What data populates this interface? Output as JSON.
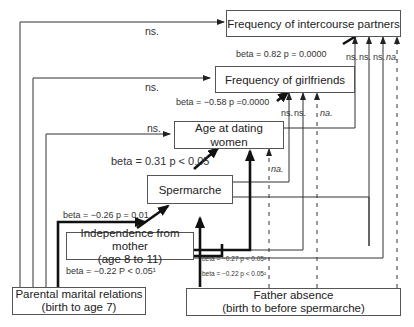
{
  "nodes": {
    "intercourse": {
      "label": "Frequency of intercourse partners"
    },
    "girlfriends": {
      "label": "Frequency of girlfriends"
    },
    "dating": {
      "label": "Age at dating women"
    },
    "spermarche": {
      "label": "Spermarche"
    },
    "independence": {
      "line1": "Independence from mother",
      "line2": "(age 8 to 11)"
    },
    "parental": {
      "line1": "Parental marital relations",
      "line2": "(birth to age 7)"
    },
    "father": {
      "line1": "Father absence",
      "line2": "(birth to before spermarche)"
    }
  },
  "edges": {
    "girlfriends_to_intercourse": "beta = 0.82 p = 0.0000",
    "dating_to_girlfriends": "beta = −0.58 p =0.0000",
    "spermarche_to_dating": "beta = 0.31 p < 0.05",
    "independence_to_spermarche": "beta = −0.26 p = 0.01",
    "parental_to_independence": "beta = −0.22 P < 0.05¹",
    "father_to_independence_a": "beta = −0.27 p < 0.05²",
    "father_to_independence_b": "beta = −0.22 p < 0.05²",
    "parental_to_intercourse": "ns.",
    "parental_to_girlfriends": "ns.",
    "parental_to_dating": "ns.",
    "into_intercourse": [
      "ns.",
      "ns.",
      "ns.",
      "na."
    ],
    "into_girlfriends": [
      "ns.",
      "ns.",
      "na."
    ],
    "into_dating": "na."
  }
}
